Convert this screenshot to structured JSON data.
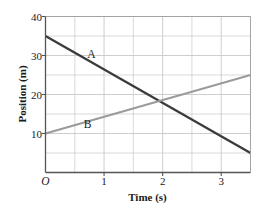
{
  "chart_data": {
    "type": "line",
    "title": "",
    "xlabel": "Time (s)",
    "ylabel": "Position (m)",
    "xlim": [
      0,
      3.5
    ],
    "ylim": [
      0,
      40
    ],
    "grid": true,
    "grid_x_step": 0.5,
    "grid_y_step": 5,
    "x_tick_labels": [
      "O",
      "1",
      "2",
      "3"
    ],
    "x_tick_values": [
      0,
      1,
      2,
      3
    ],
    "y_tick_labels": [
      "10",
      "20",
      "30",
      "40"
    ],
    "y_tick_values": [
      10,
      20,
      30,
      40
    ],
    "legend": "inline-labels",
    "series": [
      {
        "name": "A",
        "color": "#3b3b3b",
        "width": 2.3,
        "label_x": 0.78,
        "label_y": 30.2,
        "x": [
          0,
          3.5
        ],
        "y": [
          35,
          5
        ]
      },
      {
        "name": "B",
        "color": "#9a9a9a",
        "width": 1.9,
        "label_x": 0.72,
        "label_y": 12.3,
        "x": [
          0,
          3.5
        ],
        "y": [
          10,
          25
        ]
      }
    ],
    "intersection": {
      "x": 2.0,
      "y": 19.3
    },
    "axis_color": "#555555",
    "grid_color": "#c8c8c8"
  }
}
